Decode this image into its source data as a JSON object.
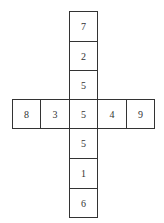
{
  "diagram": {
    "type": "cross-net",
    "vertical_column": [
      "7",
      "2",
      "5",
      "5",
      "5",
      "1",
      "6"
    ],
    "horizontal_row": [
      "8",
      "3",
      "5",
      "4",
      "9"
    ],
    "cells": [
      {
        "label": "7",
        "col": 2,
        "row": 0
      },
      {
        "label": "2",
        "col": 2,
        "row": 1
      },
      {
        "label": "5",
        "col": 2,
        "row": 2
      },
      {
        "label": "8",
        "col": 0,
        "row": 3
      },
      {
        "label": "3",
        "col": 1,
        "row": 3
      },
      {
        "label": "5",
        "col": 2,
        "row": 3
      },
      {
        "label": "4",
        "col": 3,
        "row": 3
      },
      {
        "label": "9",
        "col": 4,
        "row": 3
      },
      {
        "label": "5",
        "col": 2,
        "row": 4
      },
      {
        "label": "1",
        "col": 2,
        "row": 5
      },
      {
        "label": "6",
        "col": 2,
        "row": 6
      }
    ],
    "colors": {
      "border": "#333333",
      "text": "#333333",
      "background": "#ffffff"
    }
  }
}
